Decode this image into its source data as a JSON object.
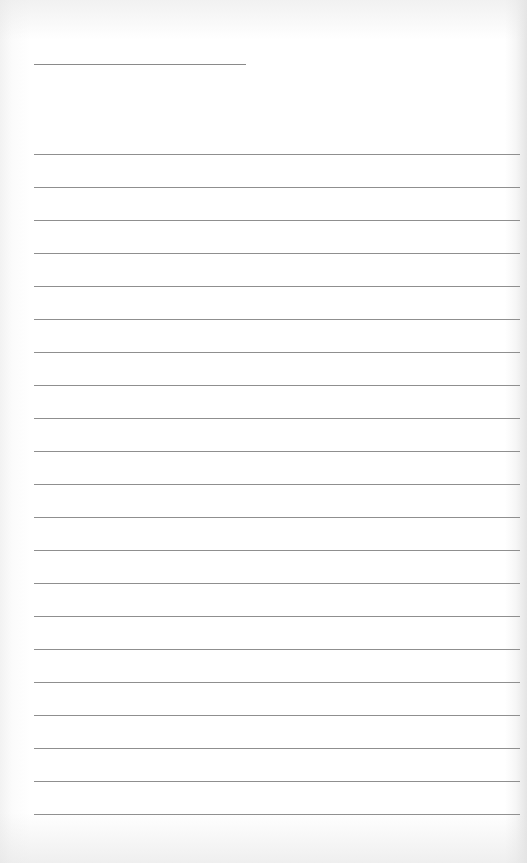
{
  "document": {
    "type": "lined-paper",
    "header_line": {
      "text": ""
    },
    "lines": [
      {
        "text": ""
      },
      {
        "text": ""
      },
      {
        "text": ""
      },
      {
        "text": ""
      },
      {
        "text": ""
      },
      {
        "text": ""
      },
      {
        "text": ""
      },
      {
        "text": ""
      },
      {
        "text": ""
      },
      {
        "text": ""
      },
      {
        "text": ""
      },
      {
        "text": ""
      },
      {
        "text": ""
      },
      {
        "text": ""
      },
      {
        "text": ""
      },
      {
        "text": ""
      },
      {
        "text": ""
      },
      {
        "text": ""
      },
      {
        "text": ""
      },
      {
        "text": ""
      },
      {
        "text": ""
      }
    ],
    "line_color": "#8f8f8f",
    "paper_color": "#ffffff"
  }
}
